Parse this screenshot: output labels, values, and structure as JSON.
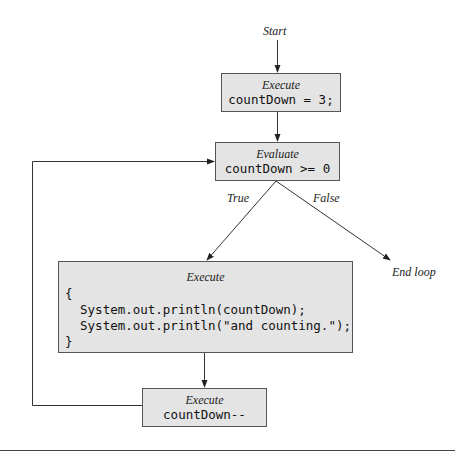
{
  "diagram": {
    "type": "flowchart",
    "colors": {
      "box_fill": "#e4e4e4",
      "box_border": "#555555",
      "line": "#333333",
      "background": "#ffffff"
    },
    "start_label": "Start",
    "init_box": {
      "keyword": "Execute",
      "code": "countDown = 3;"
    },
    "condition_box": {
      "keyword": "Evaluate",
      "code": "countDown >= 0"
    },
    "branch_true_label": "True",
    "branch_false_label": "False",
    "end_label": "End loop",
    "body_box": {
      "keyword": "Execute",
      "code_lines": [
        "{",
        "  System.out.println(countDown);",
        "  System.out.println(\"and counting.\");",
        "}"
      ]
    },
    "update_box": {
      "keyword": "Execute",
      "code": "countDown--"
    },
    "edges": [
      {
        "from": "Start",
        "to": "init_box"
      },
      {
        "from": "init_box",
        "to": "condition_box"
      },
      {
        "from": "condition_box",
        "to": "body_box",
        "label": "True"
      },
      {
        "from": "condition_box",
        "to": "End loop",
        "label": "False"
      },
      {
        "from": "body_box",
        "to": "update_box"
      },
      {
        "from": "update_box",
        "to": "condition_box"
      }
    ]
  }
}
